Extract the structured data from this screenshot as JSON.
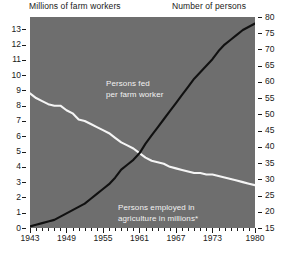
{
  "header": {
    "left_label": "Millions of farm workers",
    "right_label": "Number of persons"
  },
  "annotations": {
    "fed": "Persons fed\nper farm worker",
    "employed": "Persons employed in\nagriculture in millions*"
  },
  "colors": {
    "plot_background": "#6e6e6e",
    "page_background": "#ffffff",
    "axis_text": "#1a1a1a",
    "series_fed": "#111111",
    "series_employed": "#f5f5f5",
    "annotation_text": "#f2f2f2"
  },
  "chart_data": {
    "type": "line",
    "title": "",
    "xlabel": "",
    "ylabel": "Millions of farm workers",
    "y2label": "Number of persons",
    "grid": false,
    "legend": "annotations-inline",
    "xlim": [
      1943,
      1980
    ],
    "ylim": [
      0,
      13.8
    ],
    "y2lim": [
      15,
      80
    ],
    "x_ticks": [
      1943,
      1949,
      1955,
      1961,
      1967,
      1973,
      1980
    ],
    "x_minor_ticks": [
      1944,
      1945,
      1946,
      1947,
      1948,
      1950,
      1951,
      1952,
      1953,
      1954,
      1956,
      1957,
      1958,
      1959,
      1960,
      1962,
      1963,
      1964,
      1965,
      1966,
      1968,
      1969,
      1970,
      1971,
      1972,
      1974,
      1975,
      1976,
      1977,
      1978,
      1979
    ],
    "y_ticks_left": [
      0,
      1,
      2,
      3,
      4,
      5,
      6,
      7,
      8,
      9,
      10,
      11,
      12,
      13
    ],
    "y_ticks_right": [
      15,
      20,
      25,
      30,
      35,
      40,
      45,
      50,
      55,
      60,
      65,
      70,
      75,
      80
    ],
    "series": [
      {
        "name": "Persons employed in agriculture in millions*",
        "axis": "left",
        "color": "#f5f5f5",
        "x": [
          1943,
          1944,
          1945,
          1946,
          1947,
          1948,
          1949,
          1950,
          1951,
          1952,
          1953,
          1954,
          1955,
          1956,
          1957,
          1958,
          1959,
          1960,
          1961,
          1962,
          1963,
          1964,
          1965,
          1966,
          1967,
          1968,
          1969,
          1970,
          1971,
          1972,
          1973,
          1974,
          1975,
          1976,
          1977,
          1978,
          1979,
          1980
        ],
        "values": [
          8.8,
          8.5,
          8.3,
          8.1,
          8.0,
          8.0,
          7.7,
          7.5,
          7.1,
          7.0,
          6.8,
          6.6,
          6.4,
          6.2,
          5.9,
          5.6,
          5.4,
          5.2,
          4.9,
          4.6,
          4.4,
          4.3,
          4.2,
          4.0,
          3.9,
          3.8,
          3.7,
          3.6,
          3.6,
          3.5,
          3.5,
          3.4,
          3.3,
          3.2,
          3.1,
          3.0,
          2.9,
          2.8
        ]
      },
      {
        "name": "Persons fed per farm worker",
        "axis": "right",
        "color": "#111111",
        "x": [
          1943,
          1944,
          1945,
          1946,
          1947,
          1948,
          1949,
          1950,
          1951,
          1952,
          1953,
          1954,
          1955,
          1956,
          1957,
          1958,
          1959,
          1960,
          1961,
          1962,
          1963,
          1964,
          1965,
          1966,
          1967,
          1968,
          1969,
          1970,
          1971,
          1972,
          1973,
          1974,
          1975,
          1976,
          1977,
          1978,
          1979,
          1980
        ],
        "values": [
          15.5,
          16.0,
          16.5,
          17.0,
          17.5,
          18.5,
          19.5,
          20.5,
          21.5,
          22.5,
          24.0,
          25.5,
          27.0,
          28.5,
          30.5,
          33.0,
          34.5,
          36.0,
          38.0,
          41.0,
          43.5,
          46.0,
          48.5,
          51.0,
          53.5,
          56.0,
          58.5,
          61.0,
          63.0,
          65.0,
          67.0,
          69.5,
          71.5,
          73.0,
          74.5,
          76.0,
          77.0,
          78.0
        ]
      }
    ],
    "footnote_marker": "*"
  }
}
